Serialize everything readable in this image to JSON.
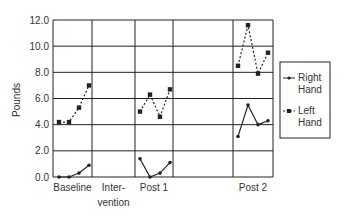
{
  "chart_data": {
    "type": "line",
    "title": "",
    "xlabel": "",
    "ylabel": "Pounds",
    "ylim": [
      0,
      12
    ],
    "yticks": [
      "0.0",
      "2.0",
      "4.0",
      "6.0",
      "8.0",
      "10.0",
      "12.0"
    ],
    "grid": true,
    "phases": [
      {
        "label": "Baseline",
        "label_lines": [
          "Baseline"
        ]
      },
      {
        "label": "Intervention",
        "label_lines": [
          "Inter-",
          "vention"
        ]
      },
      {
        "label": "Post 1",
        "label_lines": [
          "Post 1"
        ]
      },
      {
        "label": "",
        "label_lines": [
          ""
        ]
      },
      {
        "label": "Post 2",
        "label_lines": [
          "Post 2"
        ]
      }
    ],
    "series": [
      {
        "name": "Right Hand",
        "style": "solid line, circle markers",
        "values": {
          "Baseline": [
            0.0,
            0.0,
            0.3,
            0.9
          ],
          "Post 1": [
            1.4,
            0.0,
            0.3,
            1.1
          ],
          "Post 2": [
            3.1,
            5.5,
            4.0,
            4.3
          ]
        }
      },
      {
        "name": "Left Hand",
        "style": "dashed line, square markers",
        "values": {
          "Baseline": [
            4.2,
            4.2,
            5.3,
            7.0
          ],
          "Post 1": [
            5.0,
            6.3,
            4.6,
            6.7
          ],
          "Post 2": [
            8.5,
            11.6,
            7.9,
            9.5
          ]
        }
      }
    ],
    "legend": {
      "position": "right",
      "entries": [
        {
          "label_lines": [
            "Right",
            "Hand"
          ]
        },
        {
          "label_lines": [
            "Left",
            "Hand"
          ]
        }
      ]
    }
  },
  "colors": {
    "line": "#222222",
    "grid": "#222222",
    "text": "#333333"
  }
}
